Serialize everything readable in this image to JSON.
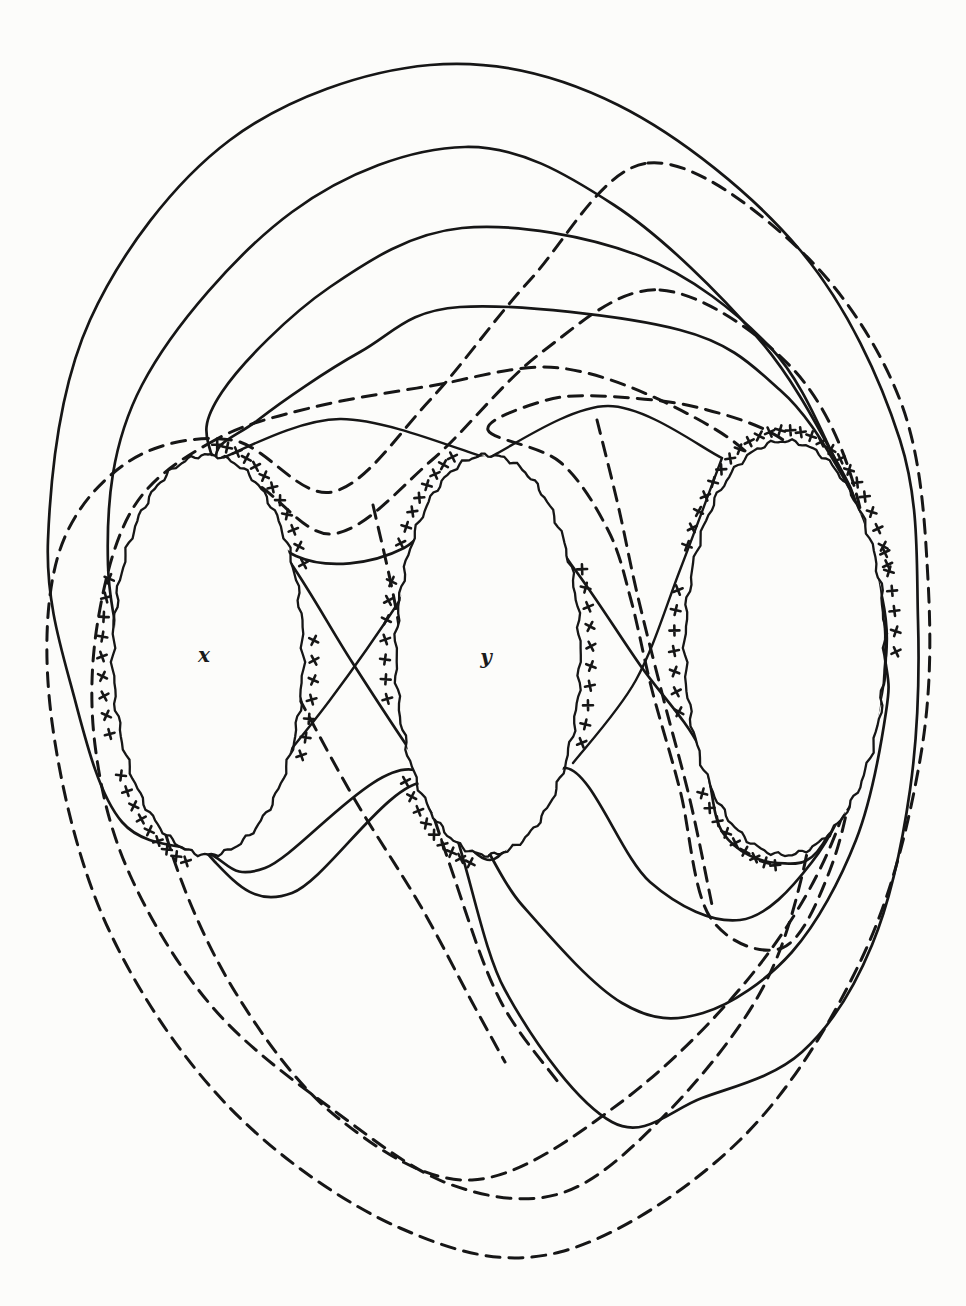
{
  "figure": {
    "background_color": "#fcfcfa",
    "ink_color": "#161616",
    "labels": [
      {
        "id": "hole-x-label",
        "text": "x",
        "x": 204,
        "y": 662
      },
      {
        "id": "hole-y-label",
        "text": "y",
        "x": 486,
        "y": 664
      }
    ],
    "holes": [
      {
        "id": "x",
        "cx": 208,
        "cy": 655,
        "rx": 95,
        "ry": 200,
        "marker_sectors": [
          [
            -85,
            -22
          ],
          [
            -4,
            32
          ],
          [
            102,
            148
          ],
          [
            158,
            202
          ]
        ]
      },
      {
        "id": "y",
        "cx": 488,
        "cy": 655,
        "rx": 92,
        "ry": 200,
        "marker_sectors": [
          [
            -148,
            -108
          ],
          [
            -24,
            28
          ],
          [
            100,
            146
          ],
          [
            168,
            202
          ]
        ]
      },
      {
        "id": "z",
        "cx": 785,
        "cy": 648,
        "rx": 100,
        "ry": 207,
        "marker_sectors": [
          [
            -152,
            -18
          ],
          [
            -26,
            4
          ],
          [
            95,
            142
          ],
          [
            163,
            200
          ]
        ]
      }
    ],
    "solid_loops": [
      {
        "id": "solid-loop-1",
        "closed": true,
        "pts": [
          [
            430,
            65
          ],
          [
            230,
            140
          ],
          [
            90,
            320
          ],
          [
            48,
            540
          ],
          [
            75,
            700
          ],
          [
            122,
            822
          ],
          [
            205,
            852
          ],
          [
            265,
            868
          ],
          [
            420,
            772
          ],
          [
            505,
            990
          ],
          [
            612,
            1122
          ],
          [
            702,
            1098
          ],
          [
            802,
            1052
          ],
          [
            872,
            945
          ],
          [
            910,
            790
          ],
          [
            918,
            620
          ],
          [
            900,
            440
          ],
          [
            800,
            250
          ],
          [
            618,
            105
          ]
        ]
      },
      {
        "id": "solid-loop-2",
        "closed": true,
        "pts": [
          [
            465,
            147
          ],
          [
            292,
            212
          ],
          [
            142,
            385
          ],
          [
            108,
            565
          ],
          [
            152,
            748
          ],
          [
            215,
            862
          ],
          [
            292,
            893
          ],
          [
            427,
            782
          ],
          [
            522,
            905
          ],
          [
            622,
            1003
          ],
          [
            703,
            1013
          ],
          [
            792,
            952
          ],
          [
            856,
            840
          ],
          [
            886,
            712
          ],
          [
            884,
            652
          ],
          [
            860,
            522
          ],
          [
            838,
            464
          ],
          [
            758,
            338
          ],
          [
            614,
            205
          ]
        ]
      },
      {
        "id": "solid-loop-3",
        "closed": true,
        "pts": [
          [
            462,
            228
          ],
          [
            330,
            287
          ],
          [
            222,
            392
          ],
          [
            214,
            461
          ],
          [
            290,
            562
          ],
          [
            352,
            662
          ],
          [
            420,
            765
          ],
          [
            490,
            860
          ],
          [
            566,
            768
          ],
          [
            650,
            882
          ],
          [
            740,
            920
          ],
          [
            812,
            862
          ],
          [
            862,
            762
          ],
          [
            886,
            652
          ],
          [
            862,
            524
          ],
          [
            837,
            463
          ],
          [
            770,
            347
          ],
          [
            640,
            256
          ]
        ]
      },
      {
        "id": "solid-loop-4",
        "closed": true,
        "pts": [
          [
            460,
            307
          ],
          [
            360,
            352
          ],
          [
            258,
            420
          ],
          [
            217,
            464
          ],
          [
            296,
            556
          ],
          [
            404,
            548
          ],
          [
            487,
            459
          ],
          [
            573,
            567
          ],
          [
            640,
            665
          ],
          [
            700,
            748
          ],
          [
            723,
            833
          ],
          [
            778,
            863
          ],
          [
            828,
            835
          ],
          [
            886,
            655
          ],
          [
            861,
            526
          ],
          [
            838,
            468
          ],
          [
            780,
            390
          ],
          [
            680,
            330
          ]
        ]
      }
    ],
    "solid_bridges": [
      {
        "id": "bridge-arc-1",
        "closed": false,
        "pts": [
          [
            215,
            461
          ],
          [
            340,
            419
          ],
          [
            487,
            458
          ]
        ]
      },
      {
        "id": "bridge-arc-2",
        "closed": false,
        "pts": [
          [
            488,
            458
          ],
          [
            608,
            406
          ],
          [
            722,
            458
          ]
        ]
      },
      {
        "id": "bridge-arc-3",
        "closed": false,
        "pts": [
          [
            487,
            459
          ],
          [
            400,
            600
          ],
          [
            330,
            700
          ],
          [
            258,
            790
          ],
          [
            208,
            851
          ]
        ]
      },
      {
        "id": "bridge-arc-4",
        "closed": false,
        "pts": [
          [
            722,
            458
          ],
          [
            680,
            570
          ],
          [
            636,
            680
          ],
          [
            573,
            763
          ]
        ]
      }
    ],
    "dashed_loops": [
      {
        "id": "dashed-loop-1",
        "closed": true,
        "pts": [
          [
            648,
            163
          ],
          [
            800,
            250
          ],
          [
            900,
            400
          ],
          [
            928,
            580
          ],
          [
            920,
            760
          ],
          [
            862,
            958
          ],
          [
            740,
            1140
          ],
          [
            560,
            1252
          ],
          [
            400,
            1228
          ],
          [
            230,
            1108
          ],
          [
            108,
            928
          ],
          [
            52,
            722
          ],
          [
            58,
            556
          ],
          [
            128,
            462
          ],
          [
            232,
            440
          ],
          [
            332,
            492
          ],
          [
            430,
            400
          ],
          [
            530,
            280
          ]
        ]
      },
      {
        "id": "dashed-loop-2",
        "closed": true,
        "pts": [
          [
            660,
            290
          ],
          [
            792,
            368
          ],
          [
            858,
            500
          ],
          [
            868,
            660
          ],
          [
            840,
            822
          ],
          [
            757,
            968
          ],
          [
            620,
            1103
          ],
          [
            472,
            1180
          ],
          [
            338,
            1118
          ],
          [
            237,
            995
          ],
          [
            170,
            848
          ],
          [
            142,
            700
          ],
          [
            157,
            565
          ],
          [
            237,
            479
          ],
          [
            332,
            534
          ],
          [
            432,
            460
          ],
          [
            542,
            352
          ]
        ]
      },
      {
        "id": "dashed-loop-3",
        "closed": true,
        "pts": [
          [
            215,
            440
          ],
          [
            135,
            505
          ],
          [
            98,
            620
          ],
          [
            95,
            745
          ],
          [
            130,
            875
          ],
          [
            215,
            1010
          ],
          [
            340,
            1115
          ],
          [
            452,
            1185
          ],
          [
            562,
            1193
          ],
          [
            662,
            1118
          ],
          [
            756,
            1000
          ],
          [
            801,
            880
          ],
          [
            820,
            740
          ],
          [
            812,
            600
          ],
          [
            770,
            480
          ],
          [
            690,
            415
          ],
          [
            560,
            368
          ],
          [
            430,
            386
          ],
          [
            310,
            408
          ]
        ]
      },
      {
        "id": "dashed-loop-4",
        "closed": true,
        "pts": [
          [
            488,
            430
          ],
          [
            560,
            462
          ],
          [
            608,
            530
          ],
          [
            631,
            600
          ],
          [
            652,
            690
          ],
          [
            680,
            790
          ],
          [
            710,
            917
          ],
          [
            782,
            948
          ],
          [
            830,
            870
          ],
          [
            855,
            760
          ],
          [
            857,
            640
          ],
          [
            838,
            520
          ],
          [
            790,
            445
          ],
          [
            700,
            408
          ],
          [
            598,
            396
          ],
          [
            540,
            402
          ]
        ]
      }
    ],
    "dashed_gap_arcs": [
      {
        "id": "gap-arc-1",
        "closed": false,
        "pts": [
          [
            373,
            505
          ],
          [
            398,
            620
          ],
          [
            412,
            740
          ],
          [
            455,
            880
          ],
          [
            500,
            1000
          ],
          [
            558,
            1082
          ]
        ]
      },
      {
        "id": "gap-arc-2",
        "closed": false,
        "pts": [
          [
            597,
            420
          ],
          [
            618,
            505
          ],
          [
            637,
            593
          ],
          [
            663,
            697
          ],
          [
            690,
            800
          ],
          [
            712,
            905
          ]
        ]
      },
      {
        "id": "gap-arc-3",
        "closed": false,
        "pts": [
          [
            232,
            505
          ],
          [
            246,
            600
          ],
          [
            300,
            700
          ],
          [
            355,
            800
          ],
          [
            420,
            905
          ],
          [
            472,
            1002
          ],
          [
            505,
            1062
          ]
        ]
      }
    ],
    "style": {
      "solid_width": 2.7,
      "dashed_width": 3.0,
      "dash_pattern": "14,9",
      "rim_width": 2.3,
      "rim_wiggle_amplitude": 1.5,
      "marker_size": 10,
      "marker_offset": 11,
      "marker_step_degrees": 5.4
    }
  }
}
